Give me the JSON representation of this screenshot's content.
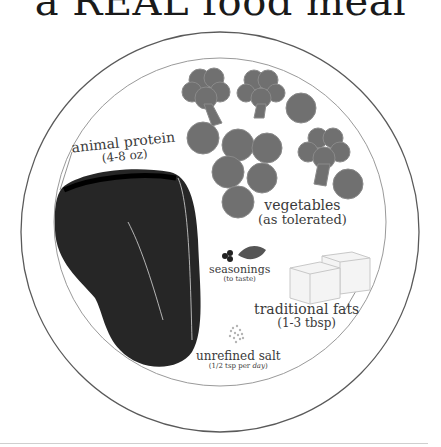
{
  "title": "a REAL food meal",
  "colors": {
    "rim": "#5a5a5a",
    "inner_rim": "#9a9a9a",
    "meat": "#262626",
    "vegetables": "#707070",
    "vegetable_outline": "#8a8a8a",
    "fat_fill": "#f4f4f4",
    "fat_outline": "#c8c8c8",
    "text": "#3a3a3a"
  },
  "sections": {
    "protein": {
      "label": "animal protein",
      "amount": "(4-8 oz)",
      "icon": "meat-steak"
    },
    "vegetables": {
      "label": "vegetables",
      "amount": "(as tolerated)",
      "icon": "broccoli-and-peas"
    },
    "seasonings": {
      "label": "seasonings",
      "amount": "(to taste)",
      "icon": "herb-leaf-and-peppercorns"
    },
    "fats": {
      "label": "traditional fats",
      "amount": "(1-3 tbsp)",
      "icon": "butter-cubes"
    },
    "salt": {
      "label": "unrefined salt",
      "amount_prefix": "(1/2 tsp per ",
      "amount_emph": "day",
      "amount_suffix": ")",
      "icon": "salt-granules"
    }
  }
}
